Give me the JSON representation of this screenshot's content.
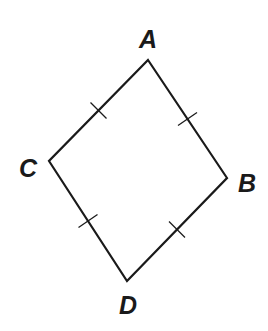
{
  "figure": {
    "type": "rhombus",
    "stroke_color": "#1a1a1a",
    "background": "#ffffff",
    "vertices": [
      {
        "label": "A",
        "x": 148,
        "y": 60
      },
      {
        "label": "B",
        "x": 227,
        "y": 178
      },
      {
        "label": "D",
        "x": 127,
        "y": 281
      },
      {
        "label": "C",
        "x": 49,
        "y": 161
      }
    ],
    "labels": {
      "A": "A",
      "B": "B",
      "C": "C",
      "D": "D"
    },
    "sides": [
      {
        "from": "A",
        "to": "B",
        "tick_marks": 1
      },
      {
        "from": "B",
        "to": "D",
        "tick_marks": 1
      },
      {
        "from": "D",
        "to": "C",
        "tick_marks": 1
      },
      {
        "from": "C",
        "to": "A",
        "tick_marks": 1
      }
    ],
    "congruent_sides_note": "All four sides marked congruent with single tick marks"
  }
}
